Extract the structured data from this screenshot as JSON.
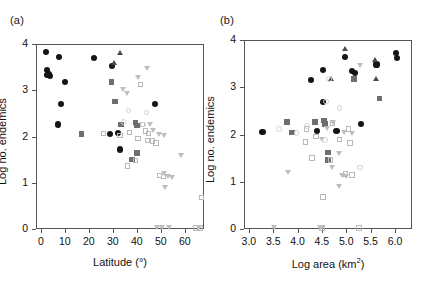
{
  "figure": {
    "width": 425,
    "height": 306,
    "background": "#ffffff"
  },
  "panels": [
    {
      "id": "a",
      "label": "(a)",
      "chart_data": {
        "type": "scatter",
        "title": "",
        "xlabel": "Latitude (°)",
        "ylabel": "Log no. endemics",
        "xlim": [
          -2,
          68
        ],
        "ylim": [
          0,
          4
        ],
        "xticks": [
          0,
          10,
          20,
          30,
          40,
          50,
          60
        ],
        "xticklabels": [
          "0",
          "10",
          "20",
          "30",
          "40",
          "50",
          "60"
        ],
        "yticks": [
          0,
          1,
          2,
          3,
          4
        ],
        "yticklabels": [
          "0",
          "1",
          "2",
          "3",
          "4"
        ],
        "grid": false,
        "legend": "none",
        "series": [
          {
            "name": "filled-circle",
            "marker": "circle-filled",
            "color": "#151515",
            "points": [
              [
                2.0,
                3.82
              ],
              [
                2.5,
                3.44
              ],
              [
                3.2,
                3.36
              ],
              [
                3.8,
                3.3
              ],
              [
                2.8,
                3.33
              ],
              [
                7.5,
                3.72
              ],
              [
                10.0,
                3.18
              ],
              [
                8.5,
                2.7
              ],
              [
                7.0,
                2.26
              ],
              [
                22.0,
                3.7
              ],
              [
                29.5,
                3.52
              ],
              [
                32.0,
                2.08
              ],
              [
                29.0,
                2.06
              ],
              [
                33.0,
                1.72
              ],
              [
                47.5,
                2.7
              ]
            ]
          },
          {
            "name": "filled-triangle",
            "marker": "tri-up-filled",
            "color": "#4a4a4a",
            "points": [
              [
                33.0,
                3.8
              ],
              [
                30.5,
                3.58
              ]
            ]
          },
          {
            "name": "filled-square",
            "marker": "square-filled",
            "color": "#6e6e6e",
            "points": [
              [
                29.5,
                3.18
              ],
              [
                31.0,
                2.76
              ],
              [
                17.0,
                2.06
              ],
              [
                33.5,
                2.26
              ],
              [
                39.5,
                2.3
              ],
              [
                40.0,
                2.24
              ],
              [
                38.0,
                1.5
              ],
              [
                40.0,
                1.64
              ]
            ]
          },
          {
            "name": "open-square",
            "marker": "square-open",
            "color": "#b9b9b9",
            "points": [
              [
                41.5,
                3.12
              ],
              [
                26.0,
                2.06
              ],
              [
                33.0,
                2.02
              ],
              [
                37.0,
                2.08
              ],
              [
                40.5,
                1.96
              ],
              [
                43.5,
                2.12
              ],
              [
                45.0,
                2.06
              ],
              [
                44.5,
                1.92
              ],
              [
                46.5,
                1.9
              ],
              [
                48.0,
                1.86
              ],
              [
                42.5,
                2.26
              ],
              [
                36.0,
                1.36
              ],
              [
                39.5,
                1.48
              ],
              [
                49.5,
                1.16
              ],
              [
                51.0,
                1.14
              ],
              [
                67.0,
                0.68
              ],
              [
                64.5,
                0.02
              ],
              [
                66.5,
                0.02
              ]
            ]
          },
          {
            "name": "open-triangle",
            "marker": "tri-down-open",
            "color": "#bdbdbd",
            "points": [
              [
                44.5,
                3.46
              ],
              [
                40.5,
                3.26
              ],
              [
                34.5,
                3.0
              ],
              [
                36.0,
                2.92
              ],
              [
                45.5,
                2.24
              ],
              [
                47.0,
                2.12
              ],
              [
                49.5,
                2.04
              ],
              [
                51.5,
                2.02
              ],
              [
                58.5,
                1.58
              ],
              [
                51.5,
                1.18
              ],
              [
                53.0,
                1.12
              ],
              [
                55.0,
                1.1
              ],
              [
                52.0,
                0.88
              ],
              [
                48.5,
                0.02
              ],
              [
                50.5,
                0.02
              ],
              [
                53.5,
                0.02
              ],
              [
                66.0,
                0.02
              ]
            ]
          },
          {
            "name": "open-circle",
            "marker": "circle-open",
            "color": "#d2d2d2",
            "points": [
              [
                36.5,
                2.56
              ],
              [
                44.0,
                2.52
              ],
              [
                42.5,
                2.26
              ],
              [
                34.5,
                2.32
              ]
            ]
          }
        ]
      }
    },
    {
      "id": "b",
      "label": "(b)",
      "chart_data": {
        "type": "scatter",
        "title": "",
        "xlabel": "Log area (km2)",
        "xlabel_base": "Log area (km",
        "xlabel_sup": "2",
        "xlabel_tail": ")",
        "ylabel": "Log no. endemics",
        "xlim": [
          2.9,
          6.35
        ],
        "ylim": [
          0,
          4
        ],
        "xticks": [
          3.0,
          3.5,
          4.0,
          4.5,
          5.0,
          5.5,
          6.0
        ],
        "xticklabels": [
          "3.0",
          "3.5",
          "4.0",
          "4.5",
          "5.0",
          "5.5",
          "6.0"
        ],
        "yticks": [
          0,
          1,
          2,
          3,
          4
        ],
        "yticklabels": [
          "0",
          "1",
          "2",
          "3",
          "4"
        ],
        "grid": false,
        "legend": "none",
        "series": [
          {
            "name": "filled-circle",
            "marker": "circle-filled",
            "color": "#151515",
            "points": [
              [
                3.28,
                2.06
              ],
              [
                4.28,
                3.16
              ],
              [
                4.52,
                3.36
              ],
              [
                4.98,
                3.64
              ],
              [
                5.12,
                3.34
              ],
              [
                5.18,
                3.3
              ],
              [
                5.62,
                3.48
              ],
              [
                6.02,
                3.72
              ],
              [
                6.04,
                3.62
              ],
              [
                4.52,
                2.68
              ],
              [
                4.8,
                2.08
              ],
              [
                5.3,
                2.22
              ],
              [
                4.4,
                2.08
              ]
            ]
          },
          {
            "name": "filled-triangle",
            "marker": "tri-up-filled",
            "color": "#4a4a4a",
            "points": [
              [
                4.98,
                3.8
              ],
              [
                5.6,
                3.58
              ],
              [
                4.7,
                3.18
              ],
              [
                5.62,
                3.18
              ]
            ]
          },
          {
            "name": "filled-square",
            "marker": "square-filled",
            "color": "#6e6e6e",
            "points": [
              [
                3.78,
                2.26
              ],
              [
                3.88,
                2.04
              ],
              [
                4.36,
                2.26
              ],
              [
                5.16,
                3.18
              ],
              [
                5.68,
                2.76
              ],
              [
                4.62,
                1.62
              ],
              [
                4.62,
                1.46
              ],
              [
                4.54,
                2.3
              ],
              [
                4.56,
                2.22
              ]
            ]
          },
          {
            "name": "open-square",
            "marker": "square-open",
            "color": "#b9b9b9",
            "points": [
              [
                4.18,
                2.12
              ],
              [
                4.16,
                1.84
              ],
              [
                4.72,
                2.24
              ],
              [
                4.3,
                1.5
              ],
              [
                4.68,
                1.46
              ],
              [
                5.04,
                2.12
              ],
              [
                5.08,
                1.82
              ],
              [
                4.98,
                1.16
              ],
              [
                5.12,
                1.14
              ],
              [
                4.52,
                0.68
              ],
              [
                5.26,
                0.02
              ],
              [
                4.5,
                0.02
              ],
              [
                4.38,
                1.96
              ],
              [
                4.86,
                1.9
              ]
            ]
          },
          {
            "name": "open-triangle",
            "marker": "tri-down-open",
            "color": "#bdbdbd",
            "points": [
              [
                5.3,
                3.46
              ],
              [
                4.74,
                2.24
              ],
              [
                4.62,
                2.12
              ],
              [
                4.96,
                2.04
              ],
              [
                5.12,
                2.02
              ],
              [
                4.52,
                1.88
              ],
              [
                4.86,
                1.58
              ],
              [
                4.72,
                1.3
              ],
              [
                3.82,
                1.18
              ],
              [
                4.92,
                1.12
              ],
              [
                5.0,
                1.1
              ],
              [
                4.86,
                0.88
              ],
              [
                3.52,
                0.02
              ],
              [
                4.46,
                0.02
              ],
              [
                4.5,
                0.02
              ]
            ]
          },
          {
            "name": "open-circle",
            "marker": "circle-open",
            "color": "#d2d2d2",
            "points": [
              [
                3.62,
                2.12
              ],
              [
                4.2,
                2.18
              ],
              [
                4.58,
                2.7
              ],
              [
                4.86,
                2.56
              ],
              [
                4.64,
                3.18
              ],
              [
                4.56,
                1.88
              ],
              [
                5.28,
                1.3
              ],
              [
                3.98,
                2.04
              ]
            ]
          }
        ]
      }
    }
  ]
}
